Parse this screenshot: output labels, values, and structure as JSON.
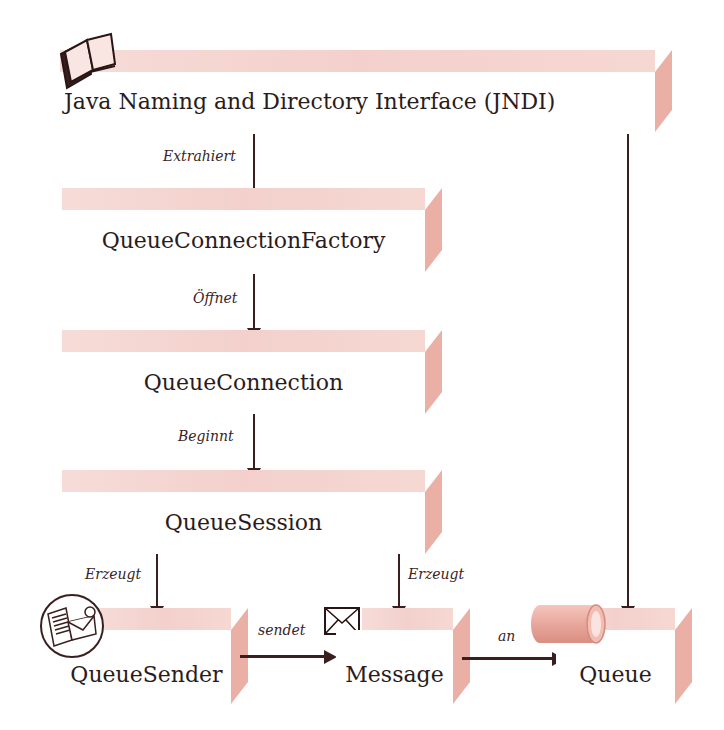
{
  "diagram": {
    "type": "flow",
    "nodes": {
      "jndi": {
        "label": "Java Naming and Directory Interface (JNDI)",
        "icon": "book-icon"
      },
      "qcf": {
        "label": "QueueConnectionFactory"
      },
      "qc": {
        "label": "QueueConnection"
      },
      "qs": {
        "label": "QueueSession"
      },
      "sender": {
        "label": "QueueSender",
        "icon": "mail-sender-icon"
      },
      "message": {
        "label": "Message",
        "icon": "envelope-icon"
      },
      "queue": {
        "label": "Queue",
        "icon": "cylinder-icon"
      }
    },
    "edges": {
      "extrahiert": {
        "from": "jndi",
        "to": "qcf",
        "label": "Extrahiert"
      },
      "oeffnet": {
        "from": "qcf",
        "to": "qc",
        "label": "Öffnet"
      },
      "beginnt": {
        "from": "qc",
        "to": "qs",
        "label": "Beginnt"
      },
      "erzeugt_sender": {
        "from": "qs",
        "to": "sender",
        "label": "Erzeugt"
      },
      "erzeugt_message": {
        "from": "qs",
        "to": "message",
        "label": "Erzeugt"
      },
      "sendet": {
        "from": "sender",
        "to": "message",
        "label": "sendet"
      },
      "an": {
        "from": "message",
        "to": "queue",
        "label": "an"
      },
      "jndi_queue": {
        "from": "jndi",
        "to": "queue",
        "label": ""
      }
    },
    "colors": {
      "band": "#f4d4cf",
      "side": "#eab0a6",
      "line": "#3a1f1f",
      "text": "#2b1b1b"
    }
  }
}
